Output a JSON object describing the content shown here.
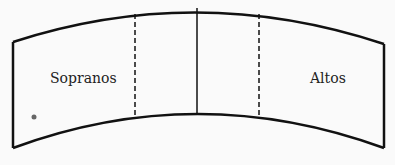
{
  "diagram": {
    "sections": [
      {
        "label": "Sopranos"
      },
      {
        "label": ""
      },
      {
        "label": ""
      },
      {
        "label": "Altos"
      }
    ],
    "colors": {
      "line": "#111111",
      "background": "#fafafa",
      "text": "#222222"
    }
  }
}
